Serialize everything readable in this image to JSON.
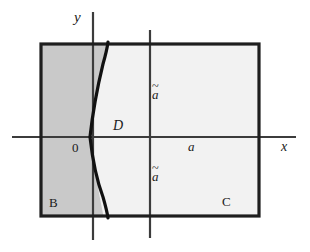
{
  "figure": {
    "type": "math-diagram",
    "background_color": "#ffffff",
    "axes": {
      "x_label": "x",
      "y_label": "y",
      "origin_label": "0",
      "x_axis_y_px": 137,
      "y_axis_x_px": 93,
      "x_axis_from_px": 12,
      "x_axis_to_px": 296,
      "y_axis_from_px": 12,
      "y_axis_to_px": 240,
      "axis_color": "#3c3c3c"
    },
    "rectangle": {
      "left_px": 41,
      "top_px": 44,
      "right_px": 259,
      "bottom_px": 216,
      "border_color": "#1e1e1e",
      "border_width_px": 3
    },
    "inner_vertical_line": {
      "x_px": 150,
      "from_y_px": 30,
      "to_y_px": 238,
      "color": "#3c3c3c"
    },
    "curve": {
      "description": "rightward-opening parabola",
      "vertex_px": [
        90,
        137
      ],
      "top_end_px": [
        108,
        42
      ],
      "bottom_end_px": [
        108,
        218
      ],
      "color": "#111111",
      "width_px": 3
    },
    "regions": [
      {
        "name": "B",
        "label": "B",
        "fill_color": "#c9c9c9"
      },
      {
        "name": "C",
        "label": "C",
        "fill_color": "#f2f2f2"
      },
      {
        "name": "D",
        "label": "D",
        "fill_color": "#f2f2f2"
      }
    ],
    "labels": {
      "y": "y",
      "x": "x",
      "origin": "0",
      "D": "D",
      "a_upper": "a",
      "a_lower": "a",
      "a_axis": "a",
      "tilde": "~",
      "B": "B",
      "C": "C"
    }
  }
}
